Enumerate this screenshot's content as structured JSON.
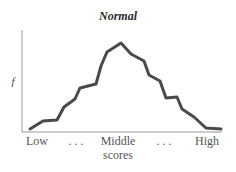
{
  "chart_data": {
    "type": "line",
    "title": "Normal",
    "xlabel": "scores",
    "ylabel": "f",
    "x_tick_labels": [
      "Low",
      "...",
      "Middle",
      "...",
      "High"
    ],
    "grid": false,
    "legend": null,
    "series": [
      {
        "name": "Normal",
        "points_px": [
          [
            30,
            129
          ],
          [
            43,
            121
          ],
          [
            57,
            120
          ],
          [
            64,
            107
          ],
          [
            75,
            99
          ],
          [
            80,
            88
          ],
          [
            96,
            84
          ],
          [
            101,
            66
          ],
          [
            107,
            52
          ],
          [
            121,
            43
          ],
          [
            131,
            54
          ],
          [
            144,
            61
          ],
          [
            149,
            75
          ],
          [
            160,
            81
          ],
          [
            166,
            98
          ],
          [
            177,
            97
          ],
          [
            182,
            109
          ],
          [
            194,
            117
          ],
          [
            206,
            128
          ],
          [
            221,
            129
          ]
        ]
      }
    ],
    "colors": {
      "line": "#4a4a4a",
      "axis": "#9a9a9a"
    }
  },
  "labels": {
    "title": "Normal",
    "ylabel": "f",
    "tick_low": "Low",
    "tick_dots_left": ". . .",
    "tick_middle": "Middle",
    "tick_middle_sub": "scores",
    "tick_dots_right": ". . .",
    "tick_high": "High"
  }
}
